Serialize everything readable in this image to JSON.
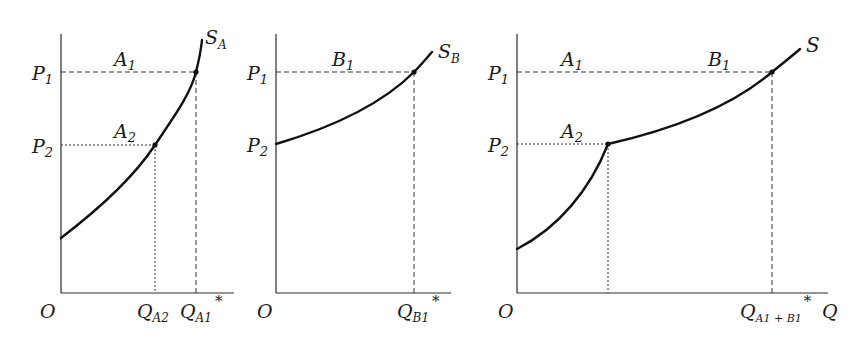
{
  "figure": {
    "panels": [
      {
        "id": "panel-a",
        "origin_label": "O",
        "price_labels": [
          {
            "main": "P",
            "sub": "1"
          },
          {
            "main": "P",
            "sub": "2"
          }
        ],
        "point_labels": [
          {
            "main": "A",
            "sub": "1"
          },
          {
            "main": "A",
            "sub": "2"
          }
        ],
        "curve_label": {
          "main": "S",
          "sub": "A"
        },
        "quantity_labels": [
          {
            "main": "Q",
            "sub": "A2",
            "sup": ""
          },
          {
            "main": "Q",
            "sub": "A1",
            "sup": "*"
          }
        ]
      },
      {
        "id": "panel-b",
        "origin_label": "O",
        "price_labels": [
          {
            "main": "P",
            "sub": "1"
          },
          {
            "main": "P",
            "sub": "2"
          }
        ],
        "point_labels": [
          {
            "main": "B",
            "sub": "1"
          }
        ],
        "curve_label": {
          "main": "S",
          "sub": "B"
        },
        "quantity_labels": [
          {
            "main": "Q",
            "sub": "B1",
            "sup": "*"
          }
        ]
      },
      {
        "id": "panel-market",
        "origin_label": "O",
        "price_labels": [
          {
            "main": "P",
            "sub": "1"
          },
          {
            "main": "P",
            "sub": "2"
          }
        ],
        "point_labels": [
          {
            "main": "A",
            "sub": "1"
          },
          {
            "main": "B",
            "sub": "1"
          },
          {
            "main": "A",
            "sub": "2"
          }
        ],
        "curve_label": {
          "main": "S",
          "sub": ""
        },
        "quantity_labels": [
          {
            "main": "Q",
            "sub": "A1 + B1",
            "sup": "*"
          }
        ],
        "x_axis_label": "Q"
      }
    ]
  },
  "colors": {
    "curve": "#111111",
    "axis": "#2a2a2a",
    "guide": "#333333",
    "background": "#ffffff"
  }
}
